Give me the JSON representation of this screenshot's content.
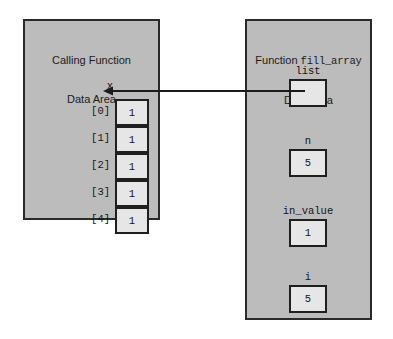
{
  "left_panel": {
    "title_line1": "Calling Function",
    "title_line2": "Data Area",
    "array_name": "x",
    "cells": [
      {
        "index": "[0]",
        "value": "1"
      },
      {
        "index": "[1]",
        "value": "1"
      },
      {
        "index": "[2]",
        "value": "1"
      },
      {
        "index": "[3]",
        "value": "1"
      },
      {
        "index": "[4]",
        "value": "1"
      }
    ]
  },
  "right_panel": {
    "title_prefix": "Function ",
    "title_function_name": "fill_array",
    "title_line2": "Data Area",
    "variables": [
      {
        "name": "list",
        "value": ""
      },
      {
        "name": "n",
        "value": "5"
      },
      {
        "name": "in_value",
        "value": "1"
      },
      {
        "name": "i",
        "value": "5"
      }
    ]
  },
  "pointer": {
    "label": "list-points-to-x0",
    "from": "list",
    "to": "x[0]"
  },
  "colors": {
    "panel_fill": "#bcbcbc",
    "panel_border": "#2a2a2a",
    "box_fill": "#e6e6e6",
    "box_border": "#1f1f1f",
    "background": "#ffffff",
    "text": "#151515"
  }
}
